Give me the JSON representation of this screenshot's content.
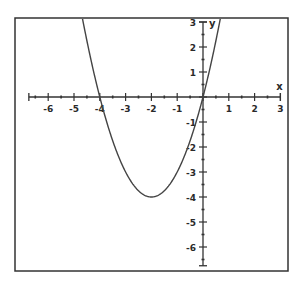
{
  "chart_data": {
    "type": "line",
    "title": "",
    "xlabel": "x",
    "ylabel": "y",
    "xlim": [
      -6.75,
      3
    ],
    "ylim": [
      -6.75,
      3
    ],
    "grid": false,
    "legend": null,
    "x_ticks": [
      -6,
      -5,
      -4,
      -3,
      -2,
      -1,
      1,
      2,
      3
    ],
    "y_ticks": [
      3,
      2,
      1,
      -1,
      -2,
      -3,
      -4,
      -5,
      -6
    ],
    "minor_ticks_per_unit": 2,
    "series": [
      {
        "name": "y = x^2 + 4x",
        "function": "x^2 + 4x",
        "vertex": [
          -2,
          -4
        ],
        "roots": [
          -4,
          0
        ],
        "x": [
          -5.0,
          -4.5,
          -4.0,
          -3.5,
          -3.0,
          -2.5,
          -2.0,
          -1.5,
          -1.0,
          -0.5,
          0.0,
          0.5,
          0.75
        ],
        "y": [
          5.0,
          2.25,
          0.0,
          -1.75,
          -3.0,
          -3.75,
          -4.0,
          -3.75,
          -3.0,
          -1.75,
          0.0,
          2.25,
          3.56
        ]
      }
    ],
    "colors": {
      "frame": "#333333",
      "axes": "#333333",
      "curve": "#444444",
      "background": "#ffffff"
    }
  }
}
